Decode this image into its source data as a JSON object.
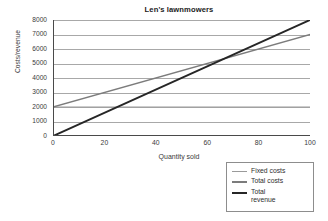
{
  "chart_data": {
    "type": "line",
    "title": "Len's lawnmowers",
    "xlabel": "Quantity sold",
    "ylabel": "Costs/revenue",
    "xlim": [
      0,
      100
    ],
    "ylim": [
      0,
      8000
    ],
    "xticks": [
      "0",
      "20",
      "40",
      "60",
      "80",
      "100"
    ],
    "xtick_values": [
      0,
      20,
      40,
      60,
      80,
      100
    ],
    "x_minor_tick_step": 5,
    "yticks": [
      "0",
      "1000",
      "2000",
      "3000",
      "4000",
      "5000",
      "6000",
      "7000",
      "8000"
    ],
    "ytick_values": [
      0,
      1000,
      2000,
      3000,
      4000,
      5000,
      6000,
      7000,
      8000
    ],
    "grid": "horizontal",
    "legend_position": "below-right",
    "x": [
      0,
      100
    ],
    "series": [
      {
        "name": "Fixed costs",
        "values": [
          2000,
          2000
        ],
        "color": "#9a9a9a",
        "width": 1.1
      },
      {
        "name": "Total costs",
        "values": [
          2000,
          7000
        ],
        "color": "#7c7c7c",
        "width": 1.4
      },
      {
        "name": "Total revenue",
        "values": [
          0,
          8000
        ],
        "color": "#262626",
        "width": 2.0
      }
    ],
    "annotations": {
      "break_even_quantity": 67,
      "break_even_value": 5333
    },
    "colors": {
      "axis": "#4a4a4a",
      "gridline": "#a8a8a8",
      "background": "#ffffff",
      "text": "#3a3a3a"
    }
  },
  "legend": {
    "items": [
      {
        "label": "Fixed costs"
      },
      {
        "label": "Total costs"
      },
      {
        "label": "Total\nrevenue"
      }
    ]
  }
}
